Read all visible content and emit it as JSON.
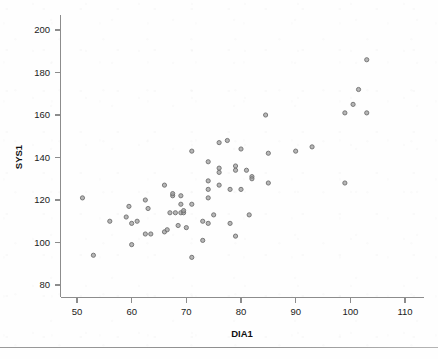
{
  "chart_data": {
    "type": "scatter",
    "title": "",
    "xlabel": "DIA1",
    "ylabel": "SYS1",
    "xlim": [
      48,
      112
    ],
    "ylim": [
      76,
      204
    ],
    "xticks": [
      50,
      60,
      70,
      80,
      90,
      100,
      110
    ],
    "yticks": [
      80,
      100,
      120,
      140,
      160,
      180,
      200
    ],
    "grid": false,
    "legend": null,
    "marker": {
      "shape": "circle",
      "color": "#9a9a9a",
      "edge_color": "#6e6e6e",
      "size": 4.2,
      "opacity": 0.72
    },
    "series": [
      {
        "name": "SYS1 vs DIA1",
        "points": [
          [
            51,
            121
          ],
          [
            53,
            94
          ],
          [
            56,
            110
          ],
          [
            59,
            112
          ],
          [
            59.5,
            117
          ],
          [
            60,
            109
          ],
          [
            60,
            99
          ],
          [
            61,
            110
          ],
          [
            62.5,
            120
          ],
          [
            62.5,
            104
          ],
          [
            63,
            116
          ],
          [
            63.5,
            104
          ],
          [
            66,
            127
          ],
          [
            66,
            105
          ],
          [
            66.5,
            106
          ],
          [
            67,
            114
          ],
          [
            67.5,
            122
          ],
          [
            67.5,
            123
          ],
          [
            68,
            114
          ],
          [
            68.5,
            108
          ],
          [
            69,
            114
          ],
          [
            69,
            122
          ],
          [
            69,
            118
          ],
          [
            69.5,
            114
          ],
          [
            69.5,
            115
          ],
          [
            70,
            107
          ],
          [
            71,
            143
          ],
          [
            71,
            118
          ],
          [
            71,
            93
          ],
          [
            73,
            110
          ],
          [
            73,
            101
          ],
          [
            74,
            138
          ],
          [
            74,
            129
          ],
          [
            74,
            125
          ],
          [
            74,
            121
          ],
          [
            74,
            109
          ],
          [
            75,
            113
          ],
          [
            76,
            147
          ],
          [
            76,
            127
          ],
          [
            76,
            135
          ],
          [
            76,
            133
          ],
          [
            77.5,
            148
          ],
          [
            78,
            125
          ],
          [
            78,
            109
          ],
          [
            79,
            136
          ],
          [
            79,
            134
          ],
          [
            79,
            103
          ],
          [
            80,
            144
          ],
          [
            80,
            125
          ],
          [
            81,
            134
          ],
          [
            81.5,
            113
          ],
          [
            82,
            131
          ],
          [
            82,
            130
          ],
          [
            84.5,
            160
          ],
          [
            85,
            142
          ],
          [
            85,
            128
          ],
          [
            90,
            143
          ],
          [
            93,
            145
          ],
          [
            99,
            128
          ],
          [
            99,
            161
          ],
          [
            100.5,
            165
          ],
          [
            101.5,
            172
          ],
          [
            103,
            186
          ],
          [
            103,
            161
          ]
        ]
      }
    ]
  },
  "axes": {
    "x_tick_labels": [
      "50",
      "60",
      "70",
      "80",
      "90",
      "100",
      "110"
    ],
    "y_tick_labels": [
      "80",
      "100",
      "120",
      "140",
      "160",
      "180",
      "200"
    ],
    "x_axis_title": "DIA1",
    "y_axis_title": "SYS1"
  },
  "colors": {
    "marker_fill": "#9a9a9a",
    "marker_stroke": "#6e6e6e",
    "axis": "#8c8c8c",
    "text": "#1b1b1b",
    "background": "#fefefe",
    "footer_rule": "#9a9a9a"
  }
}
